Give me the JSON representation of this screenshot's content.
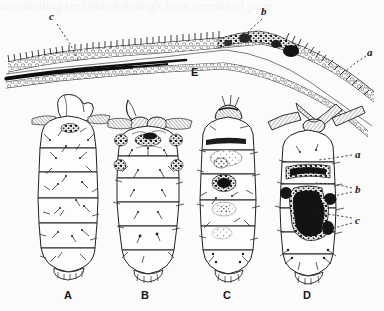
{
  "figure": {
    "kind": "scientific-plate",
    "medium": "halftone book illustration, black ink on off-white paper",
    "background_color": "#fbfbfb",
    "ink_color": "#1a1a1a",
    "ghost_text": "surrounding text bleed-through from reverse of page",
    "panel_letters": [
      {
        "label": "A",
        "x": 68,
        "y": 296
      },
      {
        "label": "B",
        "x": 145,
        "y": 296
      },
      {
        "label": "C",
        "x": 227,
        "y": 296
      },
      {
        "label": "D",
        "x": 307,
        "y": 296
      }
    ],
    "section_label": {
      "label": "E",
      "x": 195,
      "y": 76
    },
    "section_callouts": [
      {
        "label": "c",
        "x": 53,
        "y": 17,
        "tip_x": 78,
        "tip_y": 60
      },
      {
        "label": "b",
        "x": 265,
        "y": 12,
        "tip_x": 243,
        "tip_y": 38
      },
      {
        "label": "a",
        "x": 371,
        "y": 53,
        "tip_x": 345,
        "tip_y": 72
      }
    ],
    "larva_d_callouts": [
      {
        "label": "a",
        "x": 359,
        "y": 155,
        "tips": [
          [
            318,
            160
          ]
        ]
      },
      {
        "label": "b",
        "x": 359,
        "y": 190,
        "tips": [
          [
            316,
            183
          ],
          [
            318,
            199
          ]
        ]
      },
      {
        "label": "c",
        "x": 359,
        "y": 221,
        "tips": [
          [
            315,
            213
          ],
          [
            318,
            231
          ]
        ]
      }
    ],
    "larvae": [
      {
        "id": "A",
        "caption": "A",
        "pigmentation": "least",
        "cx": 68,
        "top": 101,
        "bottom": 283,
        "width": 64
      },
      {
        "id": "B",
        "caption": "B",
        "pigmentation": "light",
        "cx": 145,
        "top": 101,
        "bottom": 283,
        "width": 66
      },
      {
        "id": "C",
        "caption": "C",
        "pigmentation": "moderate",
        "cx": 227,
        "top": 101,
        "bottom": 283,
        "width": 64
      },
      {
        "id": "D",
        "caption": "D",
        "pigmentation": "heaviest",
        "cx": 307,
        "top": 101,
        "bottom": 283,
        "width": 62
      }
    ]
  }
}
